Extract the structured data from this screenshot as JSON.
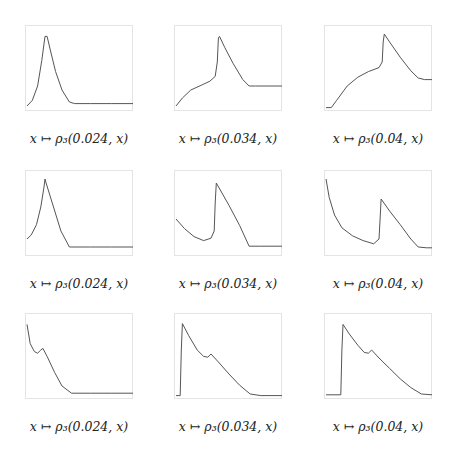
{
  "figure": {
    "panels": [
      {
        "row": 0,
        "col": 0,
        "caption": "x ↦ ρ₃(0.024, x)",
        "t": "0.024"
      },
      {
        "row": 0,
        "col": 1,
        "caption": "x ↦ ρ₃(0.034, x)",
        "t": "0.034"
      },
      {
        "row": 0,
        "col": 2,
        "caption": "x ↦ ρ₃(0.04, x)",
        "t": "0.04"
      },
      {
        "row": 1,
        "col": 0,
        "caption": "x ↦ ρ₃(0.024, x)",
        "t": "0.024"
      },
      {
        "row": 1,
        "col": 1,
        "caption": "x ↦ ρ₃(0.034, x)",
        "t": "0.034"
      },
      {
        "row": 1,
        "col": 2,
        "caption": "x ↦ ρ₃(0.04, x)",
        "t": "0.04"
      },
      {
        "row": 2,
        "col": 0,
        "caption": "x ↦ ρ₃(0.024, x)",
        "t": "0.024"
      },
      {
        "row": 2,
        "col": 1,
        "caption": "x ↦ ρ₃(0.034, x)",
        "t": "0.034"
      },
      {
        "row": 2,
        "col": 2,
        "caption": "x ↦ ρ₃(0.04, x)",
        "t": "0.04"
      }
    ],
    "line_color": "#555555",
    "frame_color": "#e4e4e4"
  },
  "chart_data": [
    {
      "type": "line",
      "title": "x ↦ ρ₃(0.024, x)",
      "xlabel": "",
      "ylabel": "",
      "grid": false,
      "x": [
        0,
        0.05,
        0.1,
        0.14,
        0.17,
        0.19,
        0.22,
        0.27,
        0.33,
        0.4,
        0.45,
        0.6,
        0.8,
        1
      ],
      "y": [
        0.05,
        0.12,
        0.3,
        0.62,
        0.92,
        0.92,
        0.75,
        0.48,
        0.25,
        0.1,
        0.08,
        0.08,
        0.08,
        0.08
      ]
    },
    {
      "type": "line",
      "title": "x ↦ ρ₃(0.034, x)",
      "xlabel": "",
      "ylabel": "",
      "grid": false,
      "x": [
        0,
        0.06,
        0.14,
        0.24,
        0.32,
        0.37,
        0.39,
        0.4,
        0.41,
        0.46,
        0.54,
        0.63,
        0.69,
        0.75,
        0.85,
        1
      ],
      "y": [
        0.05,
        0.15,
        0.25,
        0.31,
        0.36,
        0.42,
        0.6,
        0.9,
        0.92,
        0.78,
        0.58,
        0.38,
        0.3,
        0.3,
        0.3,
        0.3
      ]
    },
    {
      "type": "line",
      "title": "x ↦ ρ₃(0.04, x)",
      "xlabel": "",
      "ylabel": "",
      "grid": false,
      "x": [
        0,
        0.05,
        0.1,
        0.2,
        0.3,
        0.4,
        0.5,
        0.53,
        0.54,
        0.55,
        0.6,
        0.7,
        0.8,
        0.87,
        0.93,
        1
      ],
      "y": [
        0.03,
        0.03,
        0.12,
        0.3,
        0.41,
        0.48,
        0.53,
        0.6,
        0.85,
        0.95,
        0.85,
        0.66,
        0.49,
        0.4,
        0.38,
        0.38
      ]
    },
    {
      "type": "line",
      "title": "x ↦ ρ₃(0.024, x)",
      "xlabel": "",
      "ylabel": "",
      "grid": false,
      "x": [
        0,
        0.04,
        0.09,
        0.13,
        0.16,
        0.17,
        0.18,
        0.25,
        0.32,
        0.4,
        0.6,
        0.8,
        1
      ],
      "y": [
        0.2,
        0.25,
        0.38,
        0.6,
        0.85,
        0.95,
        0.9,
        0.6,
        0.3,
        0.1,
        0.1,
        0.1,
        0.1
      ]
    },
    {
      "type": "line",
      "title": "x ↦ ρ₃(0.034, x)",
      "xlabel": "",
      "ylabel": "",
      "grid": false,
      "x": [
        0,
        0.08,
        0.17,
        0.26,
        0.33,
        0.36,
        0.37,
        0.38,
        0.5,
        0.6,
        0.69,
        0.8,
        1
      ],
      "y": [
        0.45,
        0.33,
        0.23,
        0.18,
        0.21,
        0.3,
        0.65,
        0.9,
        0.62,
        0.37,
        0.11,
        0.11,
        0.11
      ]
    },
    {
      "type": "line",
      "title": "x ↦ ρ₃(0.04, x)",
      "xlabel": "",
      "ylabel": "",
      "grid": false,
      "x": [
        0,
        0.03,
        0.08,
        0.15,
        0.25,
        0.35,
        0.45,
        0.5,
        0.51,
        0.52,
        0.6,
        0.7,
        0.8,
        0.87,
        0.95,
        1
      ],
      "y": [
        0.95,
        0.72,
        0.5,
        0.34,
        0.24,
        0.18,
        0.14,
        0.2,
        0.45,
        0.7,
        0.55,
        0.38,
        0.2,
        0.1,
        0.09,
        0.09
      ]
    },
    {
      "type": "line",
      "title": "x ↦ ρ₃(0.024, x)",
      "xlabel": "",
      "ylabel": "",
      "grid": false,
      "x": [
        0,
        0.03,
        0.07,
        0.1,
        0.13,
        0.15,
        0.19,
        0.26,
        0.33,
        0.42,
        0.6,
        0.8,
        1
      ],
      "y": [
        0.92,
        0.68,
        0.58,
        0.56,
        0.6,
        0.62,
        0.52,
        0.32,
        0.15,
        0.06,
        0.06,
        0.06,
        0.06
      ]
    },
    {
      "type": "line",
      "title": "x ↦ ρ₃(0.034, x)",
      "xlabel": "",
      "ylabel": "",
      "grid": false,
      "x": [
        0,
        0.04,
        0.05,
        0.06,
        0.12,
        0.2,
        0.26,
        0.3,
        0.33,
        0.4,
        0.5,
        0.6,
        0.7,
        0.8,
        1
      ],
      "y": [
        0.03,
        0.03,
        0.6,
        0.93,
        0.78,
        0.6,
        0.52,
        0.51,
        0.55,
        0.45,
        0.3,
        0.16,
        0.05,
        0.03,
        0.03
      ]
    },
    {
      "type": "line",
      "title": "x ↦ ρ₃(0.04, x)",
      "xlabel": "",
      "ylabel": "",
      "grid": false,
      "x": [
        0,
        0.14,
        0.15,
        0.16,
        0.22,
        0.3,
        0.36,
        0.4,
        0.43,
        0.5,
        0.6,
        0.7,
        0.8,
        0.9,
        1
      ],
      "y": [
        0.04,
        0.04,
        0.6,
        0.92,
        0.8,
        0.66,
        0.57,
        0.56,
        0.6,
        0.5,
        0.37,
        0.24,
        0.13,
        0.05,
        0.04
      ]
    }
  ]
}
